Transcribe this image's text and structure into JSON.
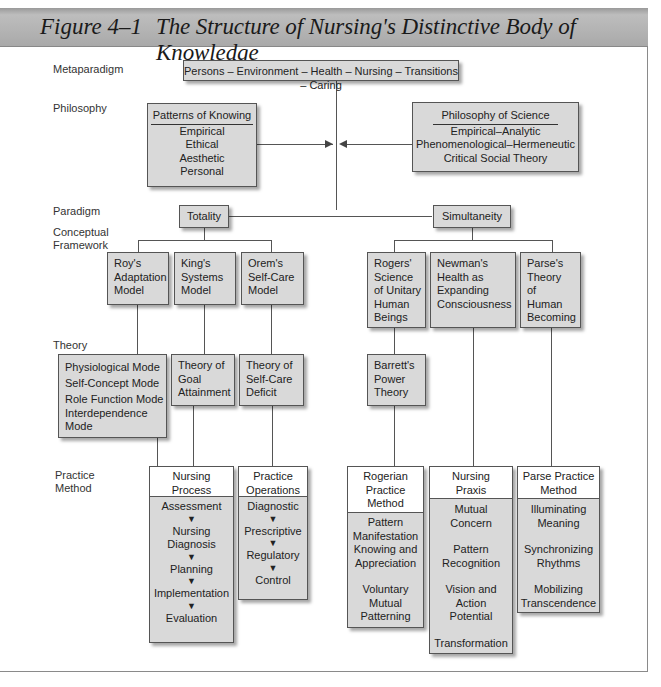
{
  "title": {
    "figure_label": "Figure 4–1",
    "text": "The Structure of Nursing's Distinctive Body of Knowledge"
  },
  "levels": {
    "metaparadigm": "Metaparadigm",
    "philosophy": "Philosophy",
    "paradigm": "Paradigm",
    "conceptual_framework_1": "Conceptual",
    "conceptual_framework_2": "Framework",
    "theory": "Theory",
    "practice_method_1": "Practice",
    "practice_method_2": "Method"
  },
  "metaparadigm": {
    "text": "Persons – Environment – Health – Nursing – Transitions – Caring"
  },
  "philosophy": {
    "patterns_of_knowing": {
      "heading": "Patterns of Knowing",
      "items": [
        "Empirical",
        "Ethical",
        "Aesthetic",
        "Personal"
      ]
    },
    "philosophy_of_science": {
      "heading": "Philosophy of Science",
      "items": [
        "Empirical–Analytic",
        "Phenomenological–Hermeneutic",
        "Critical Social Theory"
      ]
    }
  },
  "paradigm": {
    "totality": "Totality",
    "simultaneity": "Simultaneity"
  },
  "frameworks": {
    "roy": [
      "Roy's",
      "Adaptation",
      "Model"
    ],
    "king": [
      "King's",
      "Systems",
      "Model"
    ],
    "orem": [
      "Orem's",
      "Self-Care",
      "Model"
    ],
    "rogers": [
      "Rogers'",
      "Science",
      "of Unitary",
      "Human",
      "Beings"
    ],
    "newman": [
      "Newman's",
      "Health as",
      "Expanding",
      "Consciousness"
    ],
    "parse": [
      "Parse's",
      "Theory",
      "of",
      "Human",
      "Becoming"
    ]
  },
  "theories": {
    "roy_modes": [
      "Physiological Mode",
      "Self-Concept Mode",
      "Role Function Mode",
      "Interdependence",
      "Mode"
    ],
    "king": [
      "Theory of",
      "Goal",
      "Attainment"
    ],
    "orem": [
      "Theory of",
      "Self-Care",
      "Deficit"
    ],
    "barrett": [
      "Barrett's",
      "Power",
      "Theory"
    ]
  },
  "practice_methods": {
    "nursing_process": {
      "header": [
        "Nursing",
        "Process"
      ],
      "steps": [
        "Assessment",
        "Nursing",
        "Diagnosis",
        "Planning",
        "Implementation",
        "Evaluation"
      ],
      "arrow": "▼"
    },
    "practice_operations": {
      "header": [
        "Practice",
        "Operations"
      ],
      "steps": [
        "Diagnostic",
        "Prescriptive",
        "Regulatory",
        "Control"
      ],
      "arrow": "▼"
    },
    "rogerian": {
      "header": [
        "Rogerian",
        "Practice",
        "Method"
      ],
      "items": [
        "Pattern",
        "Manifestation",
        "Knowing and",
        "Appreciation",
        "Voluntary",
        "Mutual",
        "Patterning"
      ]
    },
    "nursing_praxis": {
      "header": [
        "Nursing",
        "Praxis"
      ],
      "items": [
        "Mutual",
        "Concern",
        "Pattern",
        "Recognition",
        "Vision and",
        "Action",
        "Potential",
        "Transformation"
      ]
    },
    "parse_practice": {
      "header": [
        "Parse Practice",
        "Method"
      ],
      "items": [
        "Illuminating",
        "Meaning",
        "Synchronizing",
        "Rhythms",
        "Mobilizing",
        "Transcendence"
      ]
    }
  }
}
